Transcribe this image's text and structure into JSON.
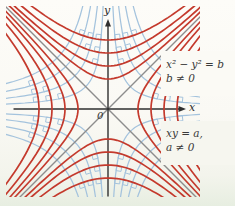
{
  "figure": {
    "background_top": "#fdfcf8",
    "background_bottom": "#e7eee1"
  },
  "axes": {
    "x_label": "x",
    "y_label": "y",
    "origin_label": "0",
    "color": "#2f2f2f"
  },
  "diagonals": {
    "color": "#8d8d8d",
    "count": 2
  },
  "annotations": {
    "red_family_line1": "x² − y² = b",
    "red_family_line2": "b ≠ 0",
    "blue_family_line1": "xy = a,",
    "blue_family_line2": "a ≠ 0"
  },
  "diagram": {
    "origin": {
      "x": 108,
      "y": 109
    },
    "clip": {
      "x1": 6,
      "y1": 6,
      "x2": 200,
      "y2": 197
    },
    "colors": {
      "red_curves": "#c43a2d",
      "blue_curves": "#a4c3dd",
      "diagonals": "#8d8d8d",
      "axes": "#2f2f2f",
      "text": "#3a3a3a"
    },
    "red_b_values": [
      900,
      1849,
      3136,
      4761
    ],
    "blue_a_values": [
      500,
      1100,
      1800,
      2600
    ],
    "right_angle_marks": {
      "size": 5,
      "axis_angle_threshold_deg": 20
    },
    "mask_boxes": [
      {
        "x": 161,
        "y": 51,
        "w": 74,
        "h": 45,
        "fill": "#fbfaf5"
      },
      {
        "x": 161,
        "y": 121,
        "w": 74,
        "h": 44,
        "fill": "#f6f6ef"
      }
    ]
  }
}
